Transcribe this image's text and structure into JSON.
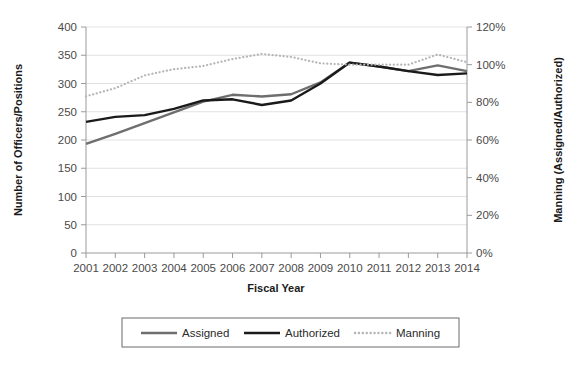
{
  "chart_data": {
    "type": "line",
    "title": "",
    "xlabel": "Fiscal Year",
    "ylabel": "Number of Officers/Positions",
    "y2label": "Manning (Assigned/Authorized)",
    "categories": [
      "2001",
      "2002",
      "2003",
      "2004",
      "2005",
      "2006",
      "2007",
      "2008",
      "2009",
      "2010",
      "2011",
      "2012",
      "2013",
      "2014"
    ],
    "ylim": [
      0,
      400
    ],
    "y2lim": [
      0,
      1.2
    ],
    "yticks": [
      "0",
      "50",
      "100",
      "150",
      "200",
      "250",
      "300",
      "350",
      "400"
    ],
    "y2ticks": [
      "0%",
      "20%",
      "40%",
      "60%",
      "80%",
      "100%",
      "120%"
    ],
    "grid": true,
    "legend_position": "bottom",
    "series": [
      {
        "name": "Assigned",
        "axis": "left",
        "style": "solid",
        "color": "#6e6e6e",
        "values": [
          193,
          211,
          230,
          249,
          268,
          280,
          277,
          281,
          302,
          337,
          330,
          322,
          332,
          322
        ]
      },
      {
        "name": "Authorized",
        "axis": "left",
        "style": "solid",
        "color": "#1a1a1a",
        "values": [
          232,
          241,
          244,
          255,
          270,
          272,
          262,
          270,
          300,
          337,
          330,
          322,
          315,
          318
        ]
      },
      {
        "name": "Manning",
        "axis": "right",
        "style": "dotted",
        "color": "#b5b5b5",
        "values": [
          0.832,
          0.875,
          0.943,
          0.976,
          0.993,
          1.03,
          1.057,
          1.041,
          1.007,
          1.0,
          1.0,
          1.0,
          1.054,
          1.013
        ]
      }
    ]
  },
  "legend": {
    "items": [
      {
        "label": "Assigned"
      },
      {
        "label": "Authorized"
      },
      {
        "label": "Manning"
      }
    ]
  }
}
